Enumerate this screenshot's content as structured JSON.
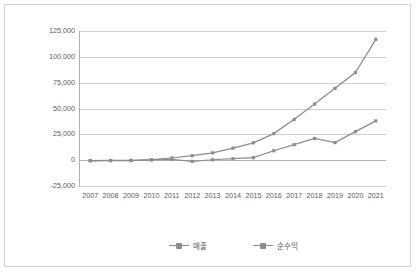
{
  "chart_data": {
    "type": "line",
    "title": "",
    "subtitle": "",
    "xlabel": "",
    "ylabel": "",
    "categories": [
      "2007",
      "2008",
      "2009",
      "2010",
      "2011",
      "2012",
      "2013",
      "2014",
      "2015",
      "2016",
      "2017",
      "2018",
      "2019",
      "2020",
      "2021"
    ],
    "series": [
      {
        "name": "매출",
        "values": [
          -400,
          -300,
          -200,
          600,
          2100,
          4300,
          7100,
          11600,
          16800,
          25700,
          39500,
          54300,
          69500,
          84800,
          116900
        ]
      },
      {
        "name": "순수익",
        "values": [
          -600,
          -500,
          -400,
          200,
          700,
          -1200,
          400,
          1400,
          2400,
          9100,
          15000,
          21000,
          17000,
          27600,
          38000
        ]
      }
    ],
    "ylim": [
      -25000,
      125000
    ],
    "ytick_values": [
      125000,
      100000,
      75000,
      50000,
      25000,
      0,
      -25000
    ],
    "ytick_labels": [
      "125,000",
      "100,000",
      "75,000",
      "50,000",
      "25,000",
      "0",
      "-25,000"
    ],
    "grid": "horizontal",
    "legend_position": "bottom",
    "marker": "square",
    "colors": {
      "series": "#8c8c8c",
      "grid": "#cfcfcf",
      "axis": "#b0b0b0",
      "text": "#5a5a5a",
      "border": "#d4d4d4",
      "background": "#ffffff"
    }
  }
}
